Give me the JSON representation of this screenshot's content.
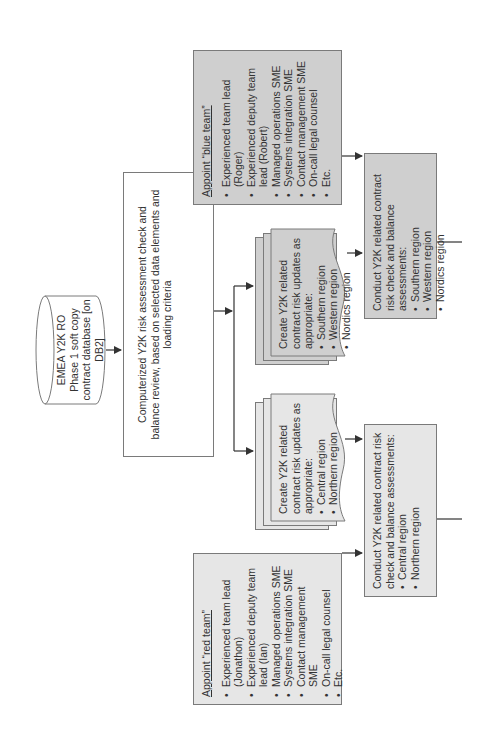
{
  "database": {
    "lines": [
      "EMEA Y2K RO",
      "Phase 1 soft copy",
      "contract database [on DB2]"
    ]
  },
  "review_step": {
    "text": "Computerized Y2K risk assessment check and balance review, based on selected data elements and loading criteria"
  },
  "red_team": {
    "title": "Appoint “red team”",
    "members": [
      "Experienced team lead (Jonathon)",
      "Experienced deputy team lead (Ian)",
      "Managed operations SME",
      "Systems integration SME",
      "Contact management SME",
      "On-call legal counsel",
      "Etc."
    ]
  },
  "blue_team": {
    "title": "Appoint “blue team”",
    "members": [
      "Experienced team lead (Roger)",
      "Experienced deputy team lead (Robert)",
      "Managed operations SME",
      "Systems integration SME",
      "Contact management SME",
      "On-call legal counsel",
      "Etc."
    ]
  },
  "updates_red": {
    "intro": "Create Y2K related contract risk updates as appropriate:",
    "regions": [
      "Central region",
      "Northern region"
    ]
  },
  "updates_blue": {
    "intro": "Create Y2K related contract risk updates as appropriate:",
    "regions": [
      "Southern region",
      "Western region",
      "Nordics region"
    ]
  },
  "assess_red": {
    "intro": "Conduct Y2K related contract risk check and balance assessments:",
    "regions": [
      "Central region",
      "Northern region"
    ]
  },
  "assess_blue": {
    "intro": "Conduct Y2K related contract risk check and balance assessments:",
    "regions": [
      "Southern region",
      "Western region",
      "Nordics region"
    ]
  },
  "colors": {
    "line": "#333333",
    "border": "#7a7a7a",
    "light_fill": "#e6e6e6",
    "dark_fill": "#cfcfcf"
  }
}
